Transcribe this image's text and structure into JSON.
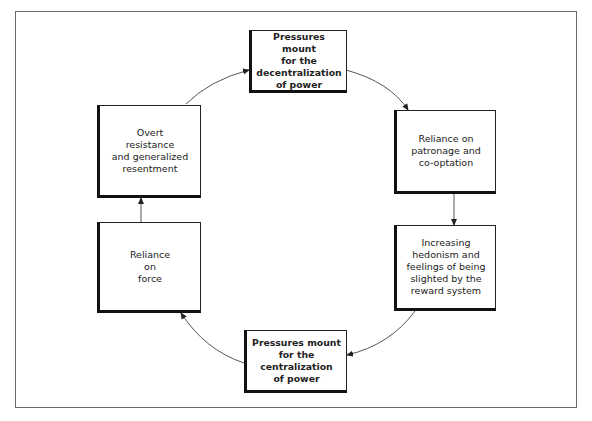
{
  "diagram": {
    "type": "cycle",
    "nodes": [
      {
        "id": "top",
        "label": "Pressures mount\nfor the\ndecentralization\nof power",
        "bold": true
      },
      {
        "id": "right-top",
        "label": "Reliance on\npatronage and\nco-optation",
        "bold": false
      },
      {
        "id": "right-bottom",
        "label": "Increasing\nhedonism and\nfeelings of being\nslighted by the\nreward system",
        "bold": false
      },
      {
        "id": "bottom",
        "label": "Pressures mount\nfor the\ncentralization\nof power",
        "bold": true
      },
      {
        "id": "left-bottom",
        "label": "Reliance\non\nforce",
        "bold": false
      },
      {
        "id": "left-top",
        "label": "Overt\nresistance\nand generalized\nresentment",
        "bold": false
      }
    ],
    "edges": [
      {
        "from": "top",
        "to": "right-top"
      },
      {
        "from": "right-top",
        "to": "right-bottom"
      },
      {
        "from": "right-bottom",
        "to": "bottom"
      },
      {
        "from": "bottom",
        "to": "left-bottom"
      },
      {
        "from": "left-bottom",
        "to": "left-top"
      },
      {
        "from": "left-top",
        "to": "top"
      }
    ],
    "colors": {
      "line": "#555555",
      "box_border": "#111111",
      "background": "#ffffff",
      "text": "#222222"
    }
  }
}
